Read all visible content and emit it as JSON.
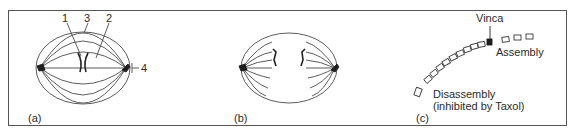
{
  "figure": {
    "panels": [
      {
        "id": "a",
        "label": "(a)",
        "description": "Metaphase spindle with chromosome at equator",
        "callouts": [
          {
            "number": "1",
            "target": "chromosome"
          },
          {
            "number": "3",
            "target": "astral/outer microtubule"
          },
          {
            "number": "2",
            "target": "kinetochore microtubule"
          },
          {
            "number": "4",
            "target": "centrosome / pole"
          }
        ]
      },
      {
        "id": "b",
        "label": "(b)",
        "description": "Anaphase spindle with separating chromatids"
      },
      {
        "id": "c",
        "label": "(c)",
        "description": "Microtubule assembly and disassembly",
        "annotations": {
          "vinca": "Vinca",
          "assembly": "Assembly",
          "disassembly": "Disassembly",
          "disassembly_note": "(inhibited by Taxol)"
        }
      }
    ],
    "colors": {
      "line": "#4a4a4a",
      "frame": "#555555",
      "fill_dark": "#1e1e1e",
      "background": "#ffffff"
    }
  }
}
